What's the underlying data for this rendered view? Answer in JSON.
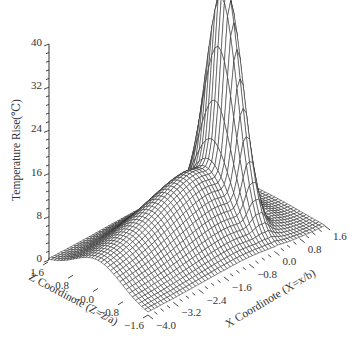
{
  "chart_data": {
    "type": "surface3d",
    "title": "",
    "zlabel": "Temperature Rise(℃)",
    "xlabel": "X Coordinote (X=x/b)",
    "ylabel": "Z Coordinote (Z=z/a)",
    "x_axis": {
      "label": "X Coordinote (X=x/b)",
      "range": [
        -4.0,
        1.6
      ],
      "ticks": [
        "-4.0",
        "-3.2",
        "-2.4",
        "-1.6",
        "-0.8",
        "0.0",
        "0.8",
        "1.6"
      ]
    },
    "z_axis": {
      "label": "Z Coordinote (Z=z/a)",
      "range": [
        -1.6,
        1.6
      ],
      "ticks": [
        "1.6",
        "0.8",
        "-0.0",
        "-0.8",
        "-1.6"
      ]
    },
    "value_axis": {
      "label": "Temperature Rise(℃)",
      "range": [
        0,
        40
      ],
      "ticks": [
        "0",
        "8",
        "16",
        "24",
        "32",
        "40"
      ],
      "minor_ticks_per_major": 4
    },
    "grid": false,
    "legend": null,
    "surface_description": "Sharp peak of ~40 near X=0, Z=0; broad ridge of ~8-14 extending toward negative X along Z≈0; shallow dip just behind the peak toward positive X.",
    "peak": {
      "x": 0.0,
      "z": 0.0,
      "value": 40
    },
    "sample_profile_along_x_at_z0": {
      "x": [
        -4.0,
        -3.2,
        -2.4,
        -1.6,
        -0.8,
        -0.4,
        0.0,
        0.4,
        0.8,
        1.6
      ],
      "value": [
        4,
        6,
        8,
        10,
        13,
        20,
        40,
        8,
        2,
        0.5
      ]
    },
    "grid_resolution": {
      "nx": 57,
      "nz": 33
    }
  },
  "axes_geometry": {
    "origin_px": [
      148,
      315
    ],
    "x_vec_px": [
      177,
      -89
    ],
    "z_vec_px": [
      -100,
      -53
    ],
    "height_px_per_40": 216
  }
}
